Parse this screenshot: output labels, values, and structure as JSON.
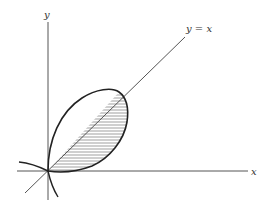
{
  "figure": {
    "labels": {
      "y_axis": "y",
      "x_axis": "x",
      "line": "y = x"
    },
    "colors": {
      "stroke": "#222222",
      "axis": "#555555",
      "hatch": "#777777",
      "background": "#ffffff"
    },
    "elements": [
      "x-axis",
      "y-axis",
      "line y = x through origin",
      "closed loop curve through origin (folium-like)",
      "hatched region between line y = x and lower part of loop"
    ]
  }
}
